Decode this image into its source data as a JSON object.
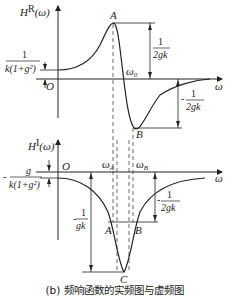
{
  "top_plot": {
    "y_axis_label": "H",
    "y_axis_sup": "R",
    "y_axis_arg": "(ω)",
    "x_axis_label": "ω",
    "origin_label": "O",
    "peak_label": "A",
    "trough_label": "B",
    "crossing_label": "ω",
    "crossing_sub": "0",
    "offset_numerator": "1",
    "offset_denominator": "k(1+g²)",
    "peak_numerator": "1",
    "peak_denominator": "2gk",
    "trough_numerator": "1",
    "trough_denominator": "2gk",
    "trough_sign": "-"
  },
  "bottom_plot": {
    "y_axis_label": "H",
    "y_axis_sup": "I",
    "y_axis_arg": "(ω)",
    "x_axis_label": "ω",
    "origin_label": "O",
    "omega_a_label": "ω",
    "omega_a_sub": "A",
    "omega_b_label": "ω",
    "omega_b_sub": "B",
    "point_a_label": "A",
    "point_b_label": "B",
    "point_c_label": "C",
    "offset_sign": "-",
    "offset_numerator": "g",
    "offset_denominator": "k(1+g²)",
    "min_sign": "-",
    "min_numerator": "1",
    "min_denominator": "gk",
    "half_sign": "-",
    "half_numerator": "1",
    "half_denominator": "2gk"
  },
  "caption": "(b) 频响函数的实频图与虚频图"
}
